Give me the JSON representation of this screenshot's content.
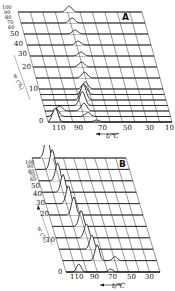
{
  "chart_data": [
    {
      "type": "line",
      "panel": "A",
      "title": "A",
      "xlabel": "t/℃",
      "zlabel": "w (%)",
      "x_ticks": [
        "110",
        "90",
        "70",
        "50",
        "30",
        "10"
      ],
      "z_ticks": [
        "0",
        "10",
        "20",
        "30",
        "40",
        "50",
        "60",
        "70",
        "80",
        "90",
        "100"
      ],
      "xlim": [
        110,
        10
      ],
      "zlim": [
        0,
        100
      ],
      "grid": true,
      "series": [
        {
          "name": "0",
          "peaks": [
            {
              "t": 106,
              "h": 14
            },
            {
              "t": 72,
              "h": 2
            }
          ]
        },
        {
          "name": "5",
          "peaks": [
            {
              "t": 104,
              "h": 8
            },
            {
              "t": 78,
              "h": 4
            }
          ]
        },
        {
          "name": "10",
          "peaks": [
            {
              "t": 100,
              "h": 5
            },
            {
              "t": 80,
              "h": 8
            }
          ]
        },
        {
          "name": "15",
          "peaks": [
            {
              "t": 80,
              "h": 14
            }
          ]
        },
        {
          "name": "20",
          "peaks": [
            {
              "t": 78,
              "h": 16
            }
          ]
        },
        {
          "name": "25",
          "peaks": [
            {
              "t": 76,
              "h": 10
            }
          ]
        },
        {
          "name": "30",
          "peaks": [
            {
              "t": 74,
              "h": 7
            }
          ]
        },
        {
          "name": "40",
          "peaks": [
            {
              "t": 72,
              "h": 6
            }
          ]
        },
        {
          "name": "50",
          "peaks": [
            {
              "t": 72,
              "h": 5
            }
          ]
        },
        {
          "name": "60",
          "peaks": [
            {
              "t": 70,
              "h": 4
            }
          ]
        },
        {
          "name": "70",
          "peaks": [
            {
              "t": 70,
              "h": 4
            }
          ]
        },
        {
          "name": "80",
          "peaks": [
            {
              "t": 70,
              "h": 4
            }
          ]
        },
        {
          "name": "90",
          "peaks": [
            {
              "t": 70,
              "h": 5
            }
          ]
        },
        {
          "name": "100",
          "peaks": [
            {
              "t": 70,
              "h": 6
            }
          ]
        }
      ]
    },
    {
      "type": "line",
      "panel": "B",
      "title": "B",
      "xlabel": "t/℃",
      "zlabel": "w (%)",
      "x_ticks": [
        "110",
        "90",
        "70",
        "50",
        "30"
      ],
      "z_ticks": [
        "0",
        "10",
        "20",
        "30",
        "40",
        "50",
        "60",
        "70",
        "80",
        "90",
        "100"
      ],
      "xlim": [
        110,
        20
      ],
      "zlim": [
        0,
        100
      ],
      "grid": true,
      "series": [
        {
          "name": "0",
          "peaks": [
            {
              "t": 102,
              "h": 8
            },
            {
              "t": 70,
              "h": 3
            }
          ]
        },
        {
          "name": "10",
          "peaks": [
            {
              "t": 80,
              "h": 16
            },
            {
              "t": 62,
              "h": 4
            }
          ]
        },
        {
          "name": "20",
          "peaks": [
            {
              "t": 82,
              "h": 14
            }
          ]
        },
        {
          "name": "30",
          "peaks": [
            {
              "t": 84,
              "h": 14
            }
          ]
        },
        {
          "name": "40",
          "peaks": [
            {
              "t": 86,
              "h": 16
            }
          ]
        },
        {
          "name": "50",
          "peaks": [
            {
              "t": 90,
              "h": 18
            }
          ]
        },
        {
          "name": "60",
          "peaks": [
            {
              "t": 92,
              "h": 18
            }
          ]
        },
        {
          "name": "70",
          "peaks": [
            {
              "t": 94,
              "h": 18
            }
          ]
        },
        {
          "name": "80",
          "peaks": [
            {
              "t": 96,
              "h": 18
            }
          ]
        },
        {
          "name": "90",
          "peaks": [
            {
              "t": 98,
              "h": 20
            }
          ]
        },
        {
          "name": "100",
          "peaks": [
            {
              "t": 100,
              "h": 24
            }
          ]
        }
      ]
    }
  ],
  "panels": {
    "A": {
      "letter": "A",
      "xlabel": "t/℃",
      "zlabel": "w (%)",
      "x_ticks": [
        "110",
        "90",
        "70",
        "50",
        "30",
        "10"
      ],
      "z_ticks": [
        "0",
        "10",
        "20",
        "30",
        "40",
        "50",
        "60",
        "70",
        "80",
        "90",
        "100"
      ]
    },
    "B": {
      "letter": "B",
      "xlabel": "t/℃",
      "zlabel": "w (%)",
      "x_ticks": [
        "110",
        "90",
        "70",
        "50",
        "30"
      ],
      "z_ticks": [
        "0",
        "10",
        "20",
        "30",
        "40",
        "50",
        "60",
        "70",
        "80",
        "90",
        "100"
      ]
    }
  }
}
